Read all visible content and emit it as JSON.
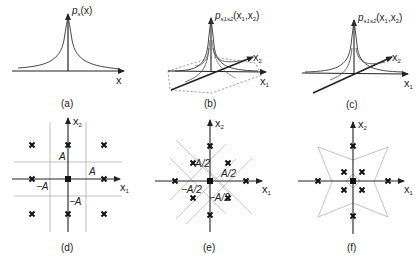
{
  "figure": {
    "panels": [
      {
        "id": "a",
        "caption": "(a)",
        "type": "1d-density",
        "ylabel": "p",
        "ylabel_sub": "s",
        "ylabel_arg": "(x)",
        "xlabel": "x"
      },
      {
        "id": "b",
        "caption": "(b)",
        "type": "2d-density-3d",
        "zlabel": "p",
        "zlabel_sub": "s1s2",
        "zlabel_arg": "(x",
        "zlabel_arg2": ",x",
        "zlabel_end": ")",
        "x1label": "x",
        "x2label": "x",
        "sub1": "1",
        "sub2": "2"
      },
      {
        "id": "c",
        "caption": "(c)",
        "type": "2d-density-3d",
        "zlabel": "p",
        "zlabel_sub": "s1s2",
        "zlabel_arg": "(x",
        "zlabel_arg2": ",x",
        "zlabel_end": ")",
        "x1label": "x",
        "x2label": "x",
        "sub1": "1",
        "sub2": "2"
      },
      {
        "id": "d",
        "caption": "(d)",
        "type": "constellation",
        "x1label": "x",
        "x2label": "x",
        "sub1": "1",
        "sub2": "2",
        "labels": [
          "A",
          "A",
          "−A",
          "−A"
        ]
      },
      {
        "id": "e",
        "caption": "(e)",
        "type": "constellation",
        "x1label": "x",
        "x2label": "x",
        "sub1": "1",
        "sub2": "2",
        "labels": [
          "A/2",
          "A/2",
          "−A/2",
          "−A/2"
        ]
      },
      {
        "id": "f",
        "caption": "(f)",
        "type": "constellation",
        "x1label": "x",
        "x2label": "x",
        "sub1": "1",
        "sub2": "2"
      }
    ]
  }
}
